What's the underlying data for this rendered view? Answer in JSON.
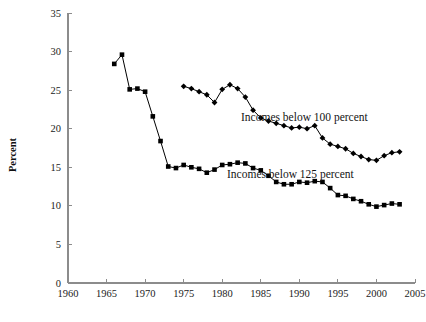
{
  "chart_data": {
    "type": "line",
    "title": "",
    "xlabel": "",
    "ylabel": "Percent",
    "xlim": [
      1960,
      2005
    ],
    "ylim": [
      0,
      35
    ],
    "xticks": [
      1960,
      1965,
      1970,
      1975,
      1980,
      1985,
      1990,
      1995,
      2000,
      2005
    ],
    "yticks": [
      0,
      5,
      10,
      15,
      20,
      25,
      30,
      35
    ],
    "grid": false,
    "legend_position": "inline-annotation",
    "series": [
      {
        "name": "Incomes below 125 percent",
        "marker": "square",
        "color": "#000000",
        "x": [
          1966,
          1967,
          1968,
          1969,
          1970,
          1971,
          1972,
          1973,
          1974,
          1975,
          1976,
          1977,
          1978,
          1979,
          1980,
          1981,
          1982,
          1983,
          1984,
          1985,
          1986,
          1987,
          1988,
          1989,
          1990,
          1991,
          1992,
          1993,
          1994,
          1995,
          1996,
          1997,
          1998,
          1999,
          2000,
          2001,
          2002,
          2003
        ],
        "values": [
          28.4,
          29.6,
          25.1,
          25.2,
          24.8,
          21.6,
          18.4,
          15.1,
          14.9,
          15.3,
          15.0,
          14.8,
          14.3,
          14.7,
          15.3,
          15.4,
          15.6,
          15.5,
          14.9,
          14.6,
          13.9,
          13.1,
          12.8,
          12.8,
          13.1,
          13.0,
          13.2,
          13.1,
          12.3,
          11.4,
          11.3,
          10.9,
          10.6,
          10.2,
          9.9,
          10.1,
          10.3,
          10.2
        ],
        "start_year": 1966,
        "end_year": 2003
      },
      {
        "name": "Incomes below 100 percent",
        "marker": "diamond",
        "color": "#000000",
        "x": [
          1975,
          1976,
          1977,
          1978,
          1979,
          1980,
          1981,
          1982,
          1983,
          1984,
          1985,
          1986,
          1987,
          1988,
          1989,
          1990,
          1991,
          1992,
          1993,
          1994,
          1995,
          1996,
          1997,
          1998,
          1999,
          2000,
          2001,
          2002,
          2003
        ],
        "values": [
          25.5,
          25.2,
          24.8,
          24.4,
          23.4,
          25.1,
          25.7,
          25.2,
          24.1,
          22.4,
          21.4,
          21.0,
          20.7,
          20.4,
          20.1,
          20.2,
          20.0,
          20.4,
          18.8,
          18.0,
          17.7,
          17.4,
          16.8,
          16.4,
          16.0,
          15.9,
          16.5,
          16.9,
          17.0
        ],
        "start_year": 1975,
        "end_year": 2003
      }
    ],
    "annotations": [
      {
        "text": "Incomes below 100 percent",
        "x_px": 241,
        "y_px": 121
      },
      {
        "text": "Incomes below 125 percent",
        "x_px": 227,
        "y_px": 178
      }
    ]
  }
}
